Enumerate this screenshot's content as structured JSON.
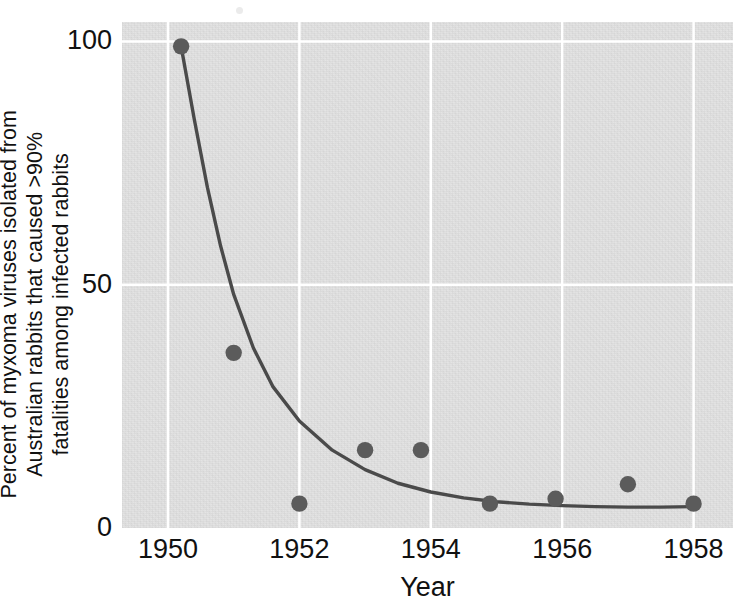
{
  "chart_data": {
    "type": "scatter",
    "title": "",
    "subtitle": "",
    "xlabel": "Year",
    "ylabel": "Percent of myxoma viruses isolated from\nAustralian rabbits that caused >90%\nfatalities among infected rabbits",
    "xlim": [
      1949.3,
      1958.6
    ],
    "ylim": [
      0,
      104
    ],
    "xticks": [
      1950,
      1952,
      1954,
      1956,
      1958
    ],
    "xtick_labels": [
      "1950",
      "1952",
      "1954",
      "1956",
      "1958"
    ],
    "yticks": [
      0,
      50,
      100
    ],
    "ytick_labels": [
      "0",
      "50",
      "100"
    ],
    "grid": true,
    "grid_color": "#ffffff",
    "plot_background": "#e2e2e2",
    "point_color": "#5b5b5b",
    "line_color": "#4a4a4a",
    "legend": null,
    "series": [
      {
        "name": "Observed percent highly virulent",
        "type": "scatter",
        "x": [
          1950.2,
          1951.0,
          1952.0,
          1953.0,
          1953.85,
          1954.9,
          1955.9,
          1957.0,
          1958.0
        ],
        "y": [
          99,
          36,
          5,
          16,
          16,
          5,
          6,
          9,
          5
        ]
      },
      {
        "name": "Fitted exponential decay curve",
        "type": "line",
        "x": [
          1950.2,
          1950.4,
          1950.6,
          1950.8,
          1951.0,
          1951.3,
          1951.6,
          1952.0,
          1952.5,
          1953.0,
          1953.5,
          1954.0,
          1954.5,
          1955.0,
          1955.5,
          1956.0,
          1956.5,
          1957.0,
          1957.5,
          1958.0
        ],
        "y": [
          99,
          84,
          70,
          58,
          48,
          37,
          29,
          22,
          16,
          12,
          9.2,
          7.4,
          6.2,
          5.4,
          4.9,
          4.6,
          4.4,
          4.3,
          4.3,
          4.4
        ]
      }
    ]
  },
  "axes": {
    "x_title": "Year",
    "y_title_lines": [
      "Percent of myxoma viruses isolated from",
      "Australian rabbits that caused >90%",
      "fatalities among infected rabbits"
    ],
    "y_title": "Percent of myxoma viruses isolated from\nAustralian rabbits that caused >90%\nfatalities among infected rabbits",
    "x_tick_labels": [
      "1950",
      "1952",
      "1954",
      "1956",
      "1958"
    ],
    "y_tick_labels": [
      "100",
      "50",
      "0"
    ]
  }
}
